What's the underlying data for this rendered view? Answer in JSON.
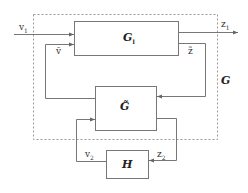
{
  "diagram": {
    "type": "block-diagram",
    "outer_system": {
      "label": "G",
      "style": "dashed"
    },
    "blocks": [
      {
        "id": "Gl",
        "label": "G",
        "subscript": "l"
      },
      {
        "id": "Gtilde",
        "label": "G̃"
      },
      {
        "id": "H",
        "label": "H"
      }
    ],
    "signals": {
      "v1": {
        "label": "v",
        "subscript": "1"
      },
      "z1": {
        "label": "z",
        "subscript": "1"
      },
      "vtilde": {
        "label": "ṽ"
      },
      "ztilde": {
        "label": "z̃"
      },
      "v2": {
        "label": "v",
        "subscript": "2"
      },
      "z2": {
        "label": "z",
        "subscript": "2"
      }
    },
    "connections": [
      {
        "from": "input",
        "to": "Gl",
        "signal": "v1"
      },
      {
        "from": "Gl",
        "to": "output",
        "signal": "z1"
      },
      {
        "from": "Gl",
        "to": "Gtilde",
        "signal": "ztilde"
      },
      {
        "from": "Gtilde",
        "to": "Gl",
        "signal": "vtilde"
      },
      {
        "from": "Gtilde",
        "to": "H",
        "signal": "z2"
      },
      {
        "from": "H",
        "to": "Gtilde",
        "signal": "v2"
      }
    ]
  }
}
